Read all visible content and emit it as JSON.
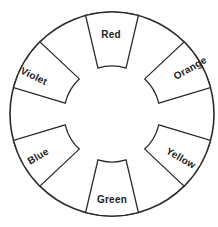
{
  "diagram": {
    "type": "color-wheel",
    "wheel": {
      "cx": 112,
      "cy": 114,
      "outer_radius": 102,
      "inner_radius": 48
    },
    "segments": [
      {
        "label": "Red",
        "angle": 90,
        "label_x": 111,
        "label_y": 34,
        "label_rotate": 0
      },
      {
        "label": "Orange",
        "angle": 30,
        "label_x": 190,
        "label_y": 68,
        "label_rotate": -30
      },
      {
        "label": "Yellow",
        "angle": -30,
        "label_x": 181,
        "label_y": 158,
        "label_rotate": 30
      },
      {
        "label": "Green",
        "angle": -90,
        "label_x": 112,
        "label_y": 199,
        "label_rotate": 0
      },
      {
        "label": "Blue",
        "angle": 210,
        "label_x": 38,
        "label_y": 156,
        "label_rotate": -30
      },
      {
        "label": "Violet",
        "angle": 150,
        "label_x": 34,
        "label_y": 76,
        "label_rotate": 26
      }
    ],
    "segment_half_width_outer_deg": 15,
    "segment_half_width_inner_deg": 17
  }
}
